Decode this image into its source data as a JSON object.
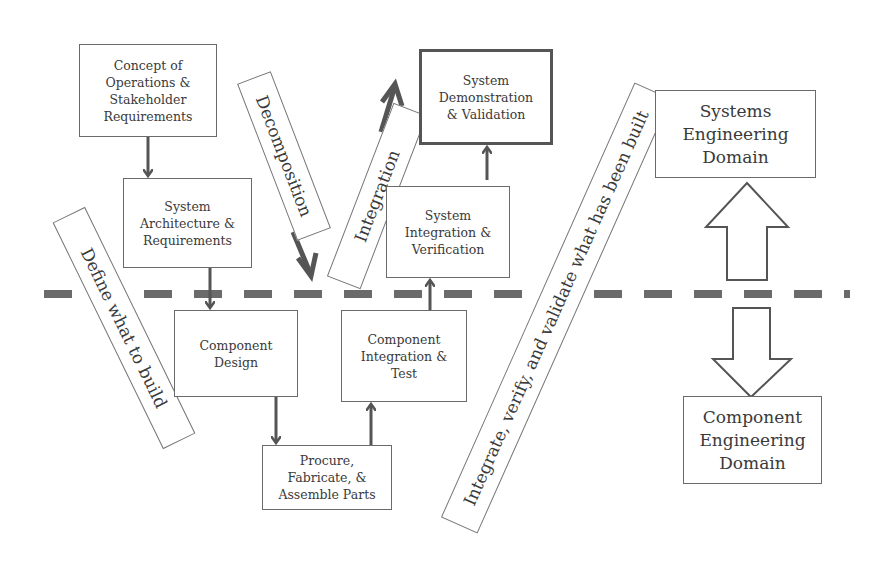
{
  "diagram": {
    "type": "systems-engineering-v-model",
    "boxes": {
      "concept_of_operations": "Concept of\nOperations &\nStakeholder\nRequirements",
      "system_architecture": "System\nArchitecture &\nRequirements",
      "component_design": "Component\nDesign",
      "procure_fabricate": "Procure,\nFabricate, &\nAssemble Parts",
      "component_integration": "Component\nIntegration &\nTest",
      "system_integration": "System\nIntegration &\nVerification",
      "system_demonstration": "System\nDemonstration\n& Validation",
      "systems_engineering_domain": "Systems\nEngineering\nDomain",
      "component_engineering_domain": "Component\nEngineering\nDomain"
    },
    "banners": {
      "define": "Define what to build",
      "decomposition": "Decomposition",
      "integration": "Integration",
      "integrate_verify": "Integrate, verify, and validate what has been built"
    },
    "divider": {
      "style": "dashed",
      "color": "#6b6b6b",
      "meaning": "boundary between systems and component engineering domains"
    },
    "colors": {
      "arrow": "#555555",
      "border": "#6a6a6a",
      "text": "#3a3a3a"
    }
  }
}
